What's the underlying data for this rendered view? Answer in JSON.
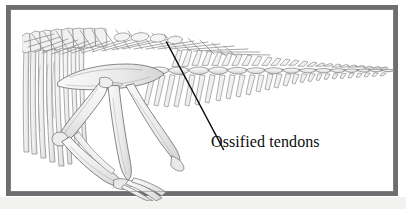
{
  "figure": {
    "frame_color": "#6e6e70",
    "background_color": "#ffffff",
    "outer_paper_color": "#f2f2f0",
    "bone_fill": "#efefef",
    "bone_outline": "#6b6b6b",
    "leader_line_color": "#0b0b0b"
  },
  "annotations": {
    "ossified_tendons_label": "Ossified tendons"
  },
  "illustration": {
    "subject": "dinosaur-skeleton-tail-and-hindlimb",
    "parts": [
      "caudal-vertebrae",
      "neural-spines",
      "chevrons",
      "ossified-tendons",
      "ilium",
      "pubis",
      "ischium",
      "femur",
      "tibia",
      "fibula",
      "foot-bones",
      "dorsal-ribs"
    ]
  }
}
